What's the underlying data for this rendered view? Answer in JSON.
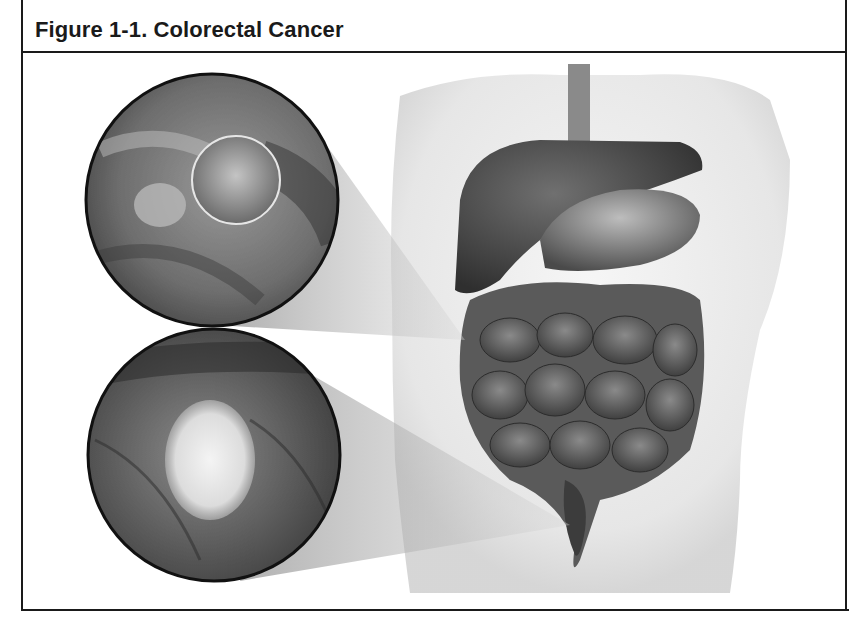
{
  "figure": {
    "title": "Figure 1-1. Colorectal Cancer",
    "illustration": {
      "description": "Anatomical illustration of abdominal organs within a translucent torso, with two magnified circular insets of colon interior",
      "insets": [
        {
          "name": "polyp",
          "label": "Colon polyp (magnified view)"
        },
        {
          "name": "tumor",
          "label": "Colorectal tumor (magnified view)"
        }
      ],
      "organs": [
        "esophagus",
        "liver",
        "stomach",
        "small intestine",
        "large intestine",
        "rectum"
      ]
    }
  },
  "colors": {
    "border": "#1a1a1a",
    "background": "#ffffff",
    "organ_dark": "#3a3a3a",
    "organ_mid": "#6b6b6b",
    "torso": "#ececec"
  }
}
